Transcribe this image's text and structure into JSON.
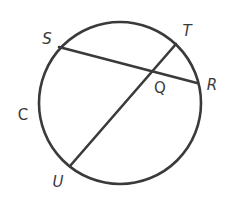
{
  "diagram": {
    "type": "circle-intersecting-chords",
    "stroke_color": "#3a3a3a",
    "stroke_width": 2.6,
    "circle": {
      "name": "C",
      "cx": 120,
      "cy": 103,
      "r": 81
    },
    "points": {
      "S": {
        "x": 59,
        "y": 47
      },
      "R": {
        "x": 197,
        "y": 83
      },
      "T": {
        "x": 176,
        "y": 44
      },
      "U": {
        "x": 70,
        "y": 166
      },
      "Q": {
        "x": 152,
        "y": 71
      }
    },
    "chords": [
      {
        "name": "SR",
        "from": "S",
        "to": "R"
      },
      {
        "name": "TU",
        "from": "T",
        "to": "U"
      }
    ],
    "labels": {
      "S": {
        "text": "S",
        "x": 47,
        "y": 39
      },
      "T": {
        "text": "T",
        "x": 187,
        "y": 31
      },
      "R": {
        "text": "R",
        "x": 212,
        "y": 85
      },
      "Q": {
        "text": "Q",
        "x": 160,
        "y": 88
      },
      "C": {
        "text": "C",
        "x": 23,
        "y": 115
      },
      "U": {
        "text": "U",
        "x": 58,
        "y": 182
      }
    }
  }
}
